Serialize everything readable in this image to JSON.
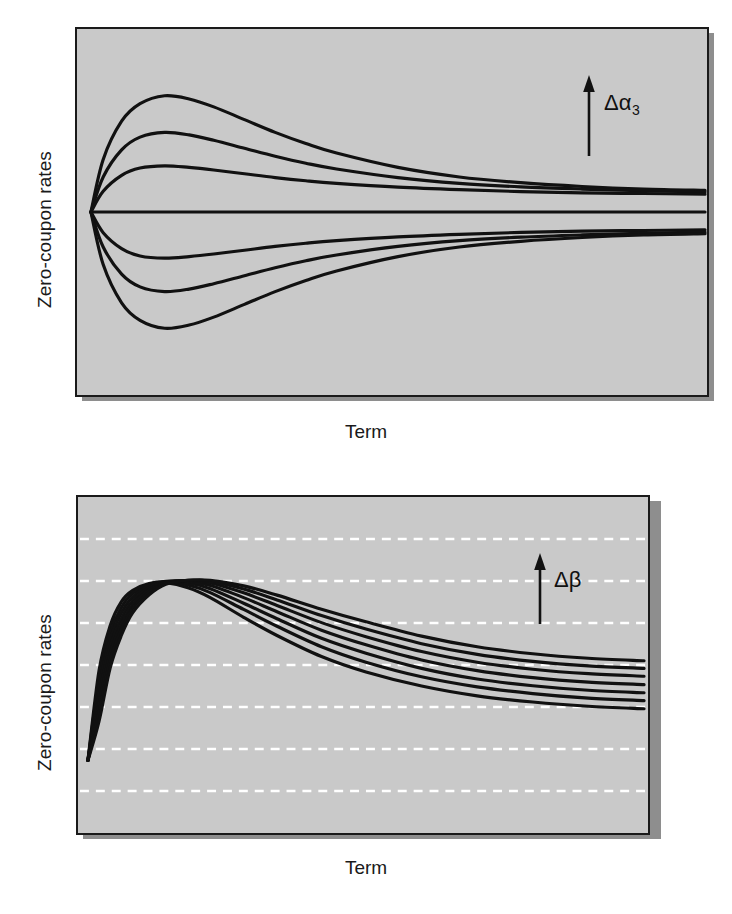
{
  "figure": {
    "background_color": "#ffffff",
    "plot_background_color": "#c9c9c9",
    "line_color": "#111111",
    "frame_color": "#1a1a1a",
    "gridline_color": "#ffffff",
    "shadow_color": "#8e8e8e"
  },
  "panels": [
    {
      "id": "top-panel",
      "y_axis_label": "Zero-coupon rates",
      "x_axis_label": "Term",
      "annotation_label": "Δα",
      "annotation_subscript": "3",
      "annotation_arrow": "up-arrow-icon",
      "gridlines": false
    },
    {
      "id": "bottom-panel",
      "y_axis_label": "Zero-coupon rates",
      "x_axis_label": "Term",
      "annotation_label": "Δβ",
      "annotation_subscript": "",
      "annotation_arrow": "up-arrow-icon",
      "gridlines": true
    }
  ],
  "chart_data": [
    {
      "type": "line",
      "title": "",
      "xlabel": "Term",
      "ylabel": "Zero-coupon rates",
      "xlim": [
        0,
        100
      ],
      "ylim": [
        0,
        100
      ],
      "grid": false,
      "annotation": "Δα3",
      "annotation_direction": "up",
      "legend": "none",
      "description": "Effect of increasing the third Nelson-Siegel curvature parameter alpha3 on the zero-coupon yield curve; curves pivot at a common short-end point and fan out, each reaching an extremum near the short/medium term before converging to distinct long-term levels.",
      "x": [
        0,
        2,
        5,
        8,
        12,
        16,
        20,
        25,
        30,
        35,
        40,
        50,
        60,
        70,
        80,
        90,
        100
      ],
      "series": [
        {
          "name": "alpha3 = +3",
          "values": [
            50,
            66.5,
            78.5,
            84.0,
            86.5,
            85.5,
            83.0,
            79.0,
            75.0,
            71.5,
            68.5,
            64.0,
            61.0,
            59.2,
            58.0,
            57.2,
            56.8
          ]
        },
        {
          "name": "alpha3 = +2",
          "values": [
            50,
            61.0,
            69.5,
            73.5,
            75.0,
            74.2,
            72.5,
            70.0,
            67.5,
            65.3,
            63.5,
            60.8,
            59.0,
            57.9,
            57.2,
            56.7,
            56.3
          ]
        },
        {
          "name": "alpha3 = +1",
          "values": [
            50,
            56.5,
            61.5,
            63.8,
            64.5,
            64.0,
            63.2,
            62.0,
            60.8,
            59.8,
            59.0,
            57.8,
            57.0,
            56.4,
            56.0,
            55.8,
            55.6
          ]
        },
        {
          "name": "alpha3 = 0",
          "values": [
            50,
            50,
            50,
            50,
            50,
            50,
            50,
            50,
            50,
            50,
            50,
            50,
            50,
            50,
            50,
            50,
            50
          ]
        },
        {
          "name": "alpha3 = -1",
          "values": [
            50,
            43.5,
            38.5,
            36.2,
            35.5,
            36.0,
            36.8,
            38.0,
            39.2,
            40.2,
            41.0,
            42.2,
            43.0,
            43.6,
            44.0,
            44.2,
            44.4
          ]
        },
        {
          "name": "alpha3 = -2",
          "values": [
            50,
            39.0,
            30.5,
            26.5,
            25.0,
            25.8,
            27.5,
            30.0,
            32.5,
            34.7,
            36.5,
            39.2,
            41.0,
            42.1,
            42.8,
            43.3,
            43.7
          ]
        },
        {
          "name": "alpha3 = -3",
          "values": [
            50,
            33.5,
            21.5,
            16.0,
            13.5,
            14.5,
            17.0,
            21.0,
            25.0,
            28.5,
            31.5,
            36.0,
            39.0,
            40.8,
            42.0,
            42.8,
            43.2
          ]
        }
      ]
    },
    {
      "type": "line",
      "title": "",
      "xlabel": "Term",
      "ylabel": "Zero-coupon rates",
      "xlim": [
        0,
        100
      ],
      "ylim": [
        0,
        100
      ],
      "grid": true,
      "gridline_count": 7,
      "gridline_style": "dashed-white",
      "annotation": "Δβ",
      "annotation_direction": "up",
      "legend": "none",
      "description": "Effect of increasing the Nelson-Siegel slope/decay parameter beta on the zero-coupon yield curve; all curves start at the same short rate, rise steeply to a hump and then decay, with larger beta shifting the hump later and the long end higher.",
      "x": [
        0,
        2,
        4,
        6,
        8,
        11,
        14,
        18,
        22,
        28,
        34,
        42,
        50,
        60,
        70,
        80,
        90,
        100
      ],
      "series": [
        {
          "name": "beta = 1 (lowest)",
          "values": [
            16,
            48,
            64,
            72.5,
            76.5,
            79.0,
            79.3,
            77.5,
            74.0,
            67.0,
            60.5,
            53.0,
            47.5,
            42.5,
            39.0,
            36.8,
            35.3,
            34.4
          ]
        },
        {
          "name": "beta = 2",
          "values": [
            16,
            45,
            61.5,
            70.5,
            75.5,
            78.8,
            79.6,
            78.5,
            75.8,
            69.8,
            63.8,
            56.5,
            51.0,
            45.8,
            42.2,
            39.8,
            38.2,
            37.3
          ]
        },
        {
          "name": "beta = 3",
          "values": [
            16,
            42,
            59,
            68.5,
            74.2,
            78.3,
            79.8,
            79.2,
            77.2,
            72.0,
            66.5,
            59.5,
            54.2,
            48.8,
            45.0,
            42.6,
            41.0,
            40.1
          ]
        },
        {
          "name": "beta = 4",
          "values": [
            16,
            39,
            56.5,
            66.5,
            72.8,
            77.6,
            79.7,
            79.8,
            78.3,
            74.0,
            69.0,
            62.4,
            57.2,
            51.8,
            48.0,
            45.5,
            43.9,
            43.0
          ]
        },
        {
          "name": "beta = 5",
          "values": [
            16,
            36,
            54,
            64.5,
            71.4,
            76.8,
            79.5,
            80.1,
            79.2,
            75.7,
            71.2,
            65.1,
            60.1,
            54.8,
            51.0,
            48.5,
            46.9,
            46.0
          ]
        },
        {
          "name": "beta = 6",
          "values": [
            16,
            33,
            51.5,
            62.5,
            70.0,
            75.9,
            79.2,
            80.2,
            79.8,
            77.1,
            73.2,
            67.6,
            62.8,
            57.6,
            53.8,
            51.3,
            49.7,
            48.8
          ]
        },
        {
          "name": "beta = 7 (highest)",
          "values": [
            16,
            30,
            49,
            60.5,
            68.5,
            75.0,
            78.8,
            80.2,
            80.2,
            78.2,
            74.9,
            69.9,
            65.4,
            60.3,
            56.5,
            54.0,
            52.4,
            51.5
          ]
        }
      ]
    }
  ]
}
